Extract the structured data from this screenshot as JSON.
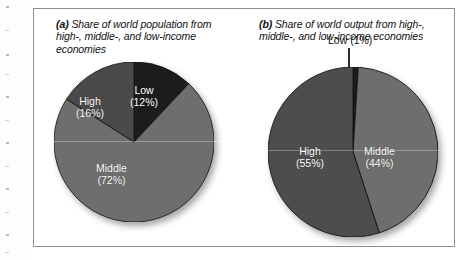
{
  "figure": {
    "panel_a": {
      "marker": "(a)",
      "caption": "Share of world population from high-, middle-, and low-income economies",
      "labels": {
        "low_name": "Low",
        "low_value": "(12%)",
        "high_name": "High",
        "high_value": "(16%)",
        "middle_name": "Middle",
        "middle_value": "(72%)"
      }
    },
    "panel_b": {
      "marker": "(b)",
      "caption": "Share of world output from high-, middle-, and low-income economies",
      "labels": {
        "low_callout": "Low (1%)",
        "high_name": "High",
        "high_value": "(55%)",
        "middle_name": "Middle",
        "middle_value": "(44%)"
      }
    }
  },
  "colors": {
    "low_fill": "#1c1c1c",
    "high_fill_a": "#4a4a4a",
    "high_fill_b": "#4d4d4d",
    "middle_fill": "#6e6e6e",
    "slice_edge": "#111111",
    "frame_border": "#8e8e8e",
    "page_background": "#ffffff",
    "label_text": "#ffffff",
    "caption_text": "#111111"
  },
  "chart_data": [
    {
      "type": "pie",
      "title": "(a) Share of world population from high-, middle-, and low-income economies",
      "categories": [
        "Low",
        "Middle",
        "High"
      ],
      "values": [
        12,
        72,
        16
      ],
      "value_labels": [
        "(12%)",
        "(72%)",
        "(16%)"
      ],
      "units": "percent",
      "start_angle_deg": 0,
      "direction": "clockwise",
      "legend": "none (labels inside slices)",
      "slice_colors": [
        "#1c1c1c",
        "#6e6e6e",
        "#4a4a4a"
      ]
    },
    {
      "type": "pie",
      "title": "(b) Share of world output from high-, middle-, and low-income economies",
      "categories": [
        "Low",
        "Middle",
        "High"
      ],
      "values": [
        1,
        44,
        55
      ],
      "value_labels": [
        "Low (1%)",
        "(44%)",
        "(55%)"
      ],
      "units": "percent",
      "start_angle_deg": 0,
      "direction": "clockwise",
      "legend": "none (labels inside slices; Low uses leader-line callout)",
      "slice_colors": [
        "#1c1c1c",
        "#6e6e6e",
        "#4d4d4d"
      ]
    }
  ]
}
